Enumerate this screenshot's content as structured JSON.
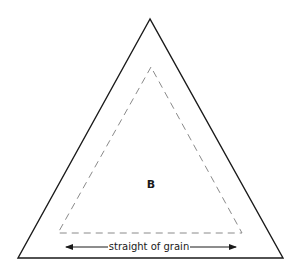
{
  "diagram": {
    "piece_label": "B",
    "grain_label": "straight of grain",
    "colors": {
      "outline": "#1a1a1a",
      "seam_line": "#8a8a8a",
      "arrow": "#1a1a1a",
      "background": "#ffffff"
    }
  }
}
